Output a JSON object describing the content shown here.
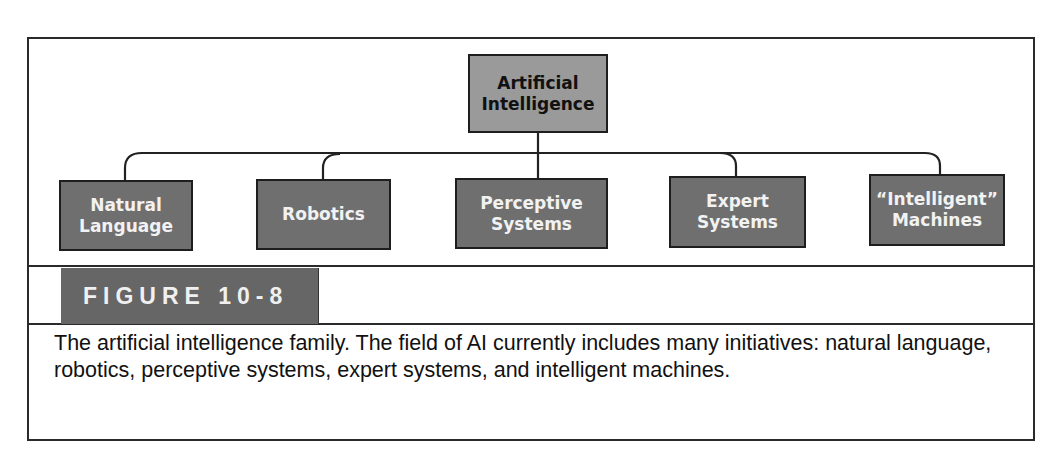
{
  "diagram": {
    "root": {
      "label_line1": "Artificial",
      "label_line2": "Intelligence"
    },
    "children": [
      {
        "label_line1": "Natural",
        "label_line2": "Language"
      },
      {
        "label_line1": "Robotics",
        "label_line2": ""
      },
      {
        "label_line1": "Perceptive",
        "label_line2": "Systems"
      },
      {
        "label_line1": "Expert",
        "label_line2": "Systems"
      },
      {
        "label_line1": "“Intelligent”",
        "label_line2": "Machines"
      }
    ]
  },
  "figure": {
    "label": "FIGURE 10-8",
    "caption": "The artificial intelligence family. The field of AI currently includes many initiatives: natural language, robotics, perceptive systems, expert systems, and intelligent machines."
  },
  "colors": {
    "root_fill": "#9a9a9a",
    "child_fill": "#6f6f6f",
    "label_band": "#666666",
    "line": "#222222"
  }
}
